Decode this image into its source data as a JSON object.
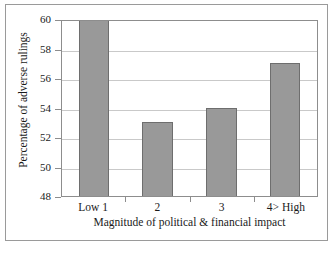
{
  "chart_data": {
    "type": "bar",
    "title": "",
    "subtitle": "",
    "categories": [
      "Low 1",
      "2",
      "3",
      "4> High"
    ],
    "values": [
      60,
      53,
      54,
      57
    ],
    "series": [
      {
        "name": "Percentage of adverse rulings",
        "values": [
          60,
          53,
          54,
          57
        ]
      }
    ],
    "xlabel": "Magnitude of political & financial impact",
    "ylabel": "Percentage of adverse rulings",
    "ylim": [
      48,
      60
    ],
    "ytick_labels": [
      "60",
      "58",
      "56",
      "54",
      "52",
      "50",
      "48"
    ],
    "ytick_values": [
      60,
      58,
      56,
      54,
      52,
      50,
      48
    ],
    "ytick_step": 2,
    "grid": "horizontal",
    "legend": "none",
    "bar_color": "#999999",
    "bar_border_color": "#6e6e6e",
    "gridline_color": "#c9c9c9",
    "axis_color": "#8d8d8d",
    "frame_color": "#9a9a9a",
    "background_color": "#ffffff"
  }
}
